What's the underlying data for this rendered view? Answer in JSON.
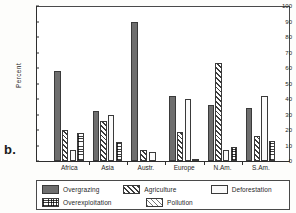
{
  "figure": {
    "panel_label": "b."
  },
  "chart_data": {
    "type": "bar",
    "title": "",
    "xlabel": "",
    "ylabel": "Percent",
    "ylim": [
      0,
      100
    ],
    "yticks": [
      0,
      10,
      20,
      30,
      40,
      50,
      60,
      70,
      80,
      90,
      100
    ],
    "ytick_labels": [
      "0",
      "10",
      "20",
      "30",
      "40",
      "50",
      "60",
      "70",
      "80",
      "90",
      "100"
    ],
    "grid": false,
    "legend_position": "bottom",
    "categories": [
      "Africa",
      "Asia",
      "Austr.",
      "Europe",
      "N.Am.",
      "S.Am."
    ],
    "series": [
      {
        "name": "Overgrazing",
        "pattern": "solid-dark-gray",
        "color": "#6e6e6e",
        "values": [
          58,
          32,
          90,
          42,
          36,
          34
        ]
      },
      {
        "name": "Agriculture",
        "pattern": "diagonal-hatch",
        "color": "#3c3c3c",
        "values": [
          20,
          26,
          7,
          19,
          63,
          16
        ]
      },
      {
        "name": "Deforestation",
        "pattern": "blank-white",
        "color": "#fbfbfb",
        "values": [
          7,
          30,
          6,
          40,
          7,
          42
        ]
      },
      {
        "name": "Overexploitation",
        "pattern": "grid-crosshatch",
        "color": "#3f3f3f",
        "values": [
          18,
          12,
          0,
          0,
          9,
          13
        ]
      },
      {
        "name": "Pollution",
        "pattern": "light-diagonal-hatch",
        "color": "#777777",
        "values": [
          0,
          0,
          0,
          1,
          0,
          0
        ]
      }
    ]
  }
}
